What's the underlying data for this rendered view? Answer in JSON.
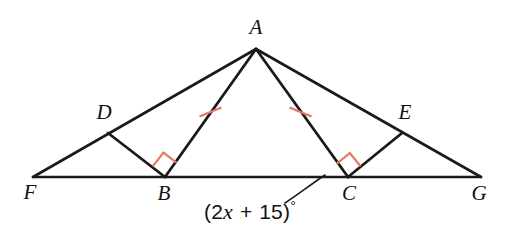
{
  "figure": {
    "kind": "geometry-diagram",
    "background_color": "#ffffff",
    "line_color": "#1a1a1a",
    "mark_color": "#e07a60",
    "labels": {
      "apex": "A",
      "left_upper": "D",
      "right_upper": "E",
      "left_base": "F",
      "left_foot": "B",
      "right_foot": "C",
      "right_base": "G"
    },
    "angle_label": {
      "prefix": "(2",
      "variable": "x",
      "operator": "+",
      "constant": "15",
      "suffix": ")",
      "degree": "°",
      "full_text": "(2x + 15)°"
    },
    "marks": {
      "right_angle_at_b": "right-angle",
      "right_angle_at_c": "right-angle",
      "tick_on_ab": "single-tick",
      "tick_on_ac": "single-tick"
    }
  },
  "points": {
    "A": {
      "x": 256,
      "y": 49
    },
    "D": {
      "x": 108,
      "y": 133
    },
    "E": {
      "x": 402,
      "y": 133
    },
    "F": {
      "x": 33,
      "y": 177
    },
    "B": {
      "x": 165,
      "y": 177
    },
    "C": {
      "x": 348,
      "y": 177
    },
    "G": {
      "x": 481,
      "y": 177
    }
  },
  "label_positions": {
    "A": {
      "x": 256,
      "y": 27
    },
    "D": {
      "x": 104,
      "y": 112
    },
    "E": {
      "x": 405,
      "y": 112
    },
    "F": {
      "x": 30,
      "y": 192
    },
    "B": {
      "x": 164,
      "y": 193
    },
    "C": {
      "x": 349,
      "y": 193
    },
    "G": {
      "x": 479,
      "y": 193
    },
    "angle": {
      "x": 250,
      "y": 211
    }
  }
}
